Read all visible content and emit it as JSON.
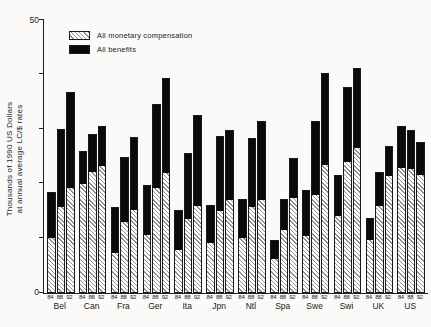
{
  "figure": {
    "background": "#fbfaf8",
    "y_axis_label_line1": "Thousands of 1990 US Dollars",
    "y_axis_label_line2": "at annual average LC/$ rates",
    "y_top_tick_label": "50",
    "y_bottom_tick_label": "0"
  },
  "legend": {
    "monetary_label": "All monetary compensation",
    "benefits_label": "All benefits"
  },
  "chart_data": {
    "type": "bar",
    "stacked": true,
    "title": "",
    "xlabel": "",
    "ylabel": "Thousands of 1990 US Dollars at annual average LC/$ rates",
    "ylim": [
      0,
      50
    ],
    "yticks": [
      0,
      10,
      20,
      30,
      40,
      50
    ],
    "ytick_labels_shown": [
      "0",
      "50"
    ],
    "grid": false,
    "legend_position": "top-left-inside",
    "bar_year_labels": [
      "84",
      "88",
      "92"
    ],
    "series_names": [
      "All monetary compensation",
      "All benefits"
    ],
    "colors": {
      "monetary": "white-diagonal-hatch",
      "benefits": "#0a0a0a"
    },
    "countries": [
      {
        "name": "Bel",
        "monetary": [
          10.2,
          15.8,
          19.3
        ],
        "benefits": [
          8.3,
          14.2,
          17.3
        ]
      },
      {
        "name": "Can",
        "monetary": [
          20.0,
          22.2,
          23.4
        ],
        "benefits": [
          6.0,
          6.9,
          7.1
        ]
      },
      {
        "name": "Fra",
        "monetary": [
          7.4,
          13.2,
          15.4
        ],
        "benefits": [
          8.3,
          11.7,
          13.0
        ]
      },
      {
        "name": "Ger",
        "monetary": [
          10.8,
          19.4,
          22.0
        ],
        "benefits": [
          8.9,
          15.1,
          17.2
        ]
      },
      {
        "name": "Ita",
        "monetary": [
          8.0,
          13.6,
          16.0
        ],
        "benefits": [
          7.1,
          11.9,
          16.5
        ]
      },
      {
        "name": "Jpn",
        "monetary": [
          9.3,
          15.1,
          17.2
        ],
        "benefits": [
          6.7,
          13.5,
          12.5
        ]
      },
      {
        "name": "Ntl",
        "monetary": [
          10.3,
          15.9,
          17.2
        ],
        "benefits": [
          6.9,
          12.4,
          14.2
        ]
      },
      {
        "name": "Spa",
        "monetary": [
          6.3,
          11.7,
          17.5
        ],
        "benefits": [
          3.3,
          5.5,
          7.1
        ]
      },
      {
        "name": "Swe",
        "monetary": [
          10.6,
          18.0,
          23.5
        ],
        "benefits": [
          8.2,
          13.3,
          16.7
        ]
      },
      {
        "name": "Swi",
        "monetary": [
          14.3,
          24.0,
          26.7
        ],
        "benefits": [
          7.2,
          13.6,
          14.3
        ]
      },
      {
        "name": "UK",
        "monetary": [
          9.9,
          16.0,
          21.6
        ],
        "benefits": [
          3.7,
          6.0,
          5.3
        ]
      },
      {
        "name": "US",
        "monetary": [
          23.0,
          22.8,
          21.8
        ],
        "benefits": [
          7.4,
          7.0,
          5.7
        ]
      }
    ]
  }
}
